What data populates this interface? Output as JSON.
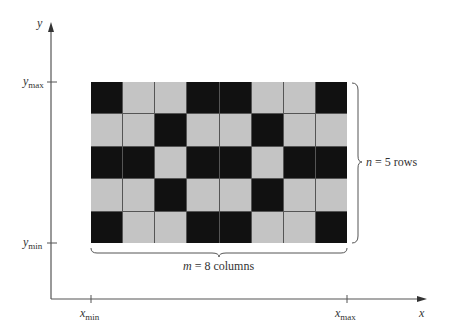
{
  "axes": {
    "y_label": "y",
    "x_label": "x",
    "y_max_label": {
      "base": "y",
      "sub": "max"
    },
    "y_min_label": {
      "base": "y",
      "sub": "min"
    },
    "x_min_label": {
      "base": "x",
      "sub": "min"
    },
    "x_max_label": {
      "base": "x",
      "sub": "max"
    }
  },
  "annotations": {
    "rows": {
      "var": "n",
      "text": " = 5 rows"
    },
    "columns": {
      "var": "m",
      "text": " = 8 columns"
    }
  },
  "grid": {
    "rows": 5,
    "columns": 8,
    "on_color": "#111111",
    "off_color": "#c4c4c4",
    "cells": [
      [
        1,
        0,
        0,
        1,
        1,
        0,
        0,
        1
      ],
      [
        0,
        0,
        1,
        0,
        0,
        1,
        0,
        0
      ],
      [
        1,
        1,
        0,
        1,
        1,
        0,
        1,
        1
      ],
      [
        0,
        0,
        1,
        0,
        0,
        1,
        0,
        0
      ],
      [
        1,
        0,
        0,
        1,
        1,
        0,
        0,
        1
      ]
    ]
  }
}
